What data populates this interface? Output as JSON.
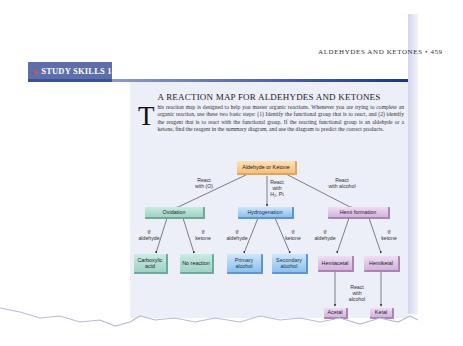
{
  "running_head": {
    "text": "ALDEHYDES AND KETONES",
    "bullet": "•",
    "page_number": "459"
  },
  "section_header": {
    "bullet": "▸",
    "label": "STUDY SKILLS 14.1"
  },
  "title": "A REACTION MAP FOR ALDEHYDES AND KETONES",
  "intro": {
    "dropcap": "T",
    "text": "his reaction map is designed to help you master organic reactions. Whenever you are trying to complete an organic reaction, use these two basic steps: (1) Identify the functional group that is to react, and (2) identify the reagent that is to react with the functional group. If the reacting functional group is an aldehyde or a ketone, find the reagent in the summary diagram, and use the diagram to predict the correct products."
  },
  "diagram": {
    "root": "Aldehyde or Ketone",
    "branches": [
      {
        "reagent": "React\nwith (O)",
        "process": "Oxidation",
        "color": "#9fd3c4",
        "left_condition": "If\naldehyde",
        "right_condition": "If\nketone",
        "left_product": "Carboxylic\nacid",
        "right_product": "No\nreaction"
      },
      {
        "reagent": "React\nwith\nH₂, Pt",
        "process": "Hydrogenation",
        "color": "#8cc0ee",
        "left_condition": "If\naldehyde",
        "right_condition": "If\nketone",
        "left_product": "Primary\nalcohol",
        "right_product": "Secondary\nalcohol"
      },
      {
        "reagent": "React\nwith alcohol",
        "process": "Hemi formation",
        "color": "#d3b3dc",
        "left_condition": "If\naldehyde",
        "right_condition": "If\nketone",
        "left_product": "Hemiacetal",
        "right_product": "Hemiketal",
        "second_reagent": "React\nwith\nalcohol",
        "left_final": "Acetal",
        "right_final": "Ketal"
      }
    ]
  },
  "colors": {
    "header_bar": "#5e6ea8",
    "rule_dark": "#1d3682",
    "panel_bg": "#eceef8",
    "root_box": "#f7c07a"
  }
}
